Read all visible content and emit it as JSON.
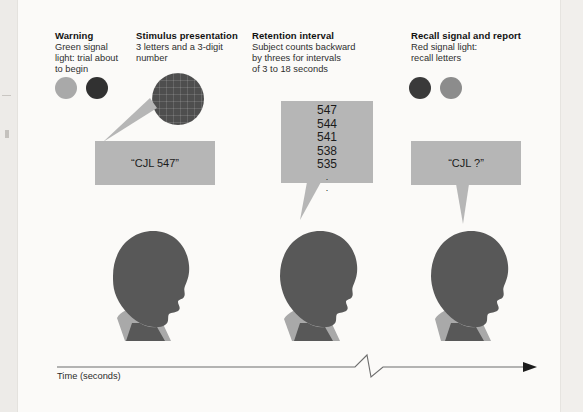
{
  "figure": {
    "time_axis_label": "Time (seconds)"
  },
  "colors": {
    "page_background": "#fbfaf8",
    "bubble_gray": "#b6b6b6",
    "head_dark": "#585858",
    "shoulder_gray": "#a9a9a9",
    "light_green_signal": "#a9a9a9",
    "dark_signal": "#3a3a3a",
    "red_signal": "#4a4a4a",
    "gray_signal": "#8c8c8c",
    "axis_line": "#6d6d6d"
  },
  "columns": [
    {
      "key": "warning",
      "title": "Warning",
      "desc": "Green signal\nlight: trial about\nto begin",
      "lights": [
        {
          "name": "green-signal-light",
          "color": "#a9a9a9"
        },
        {
          "name": "off-signal-light",
          "color": "#313131"
        }
      ]
    },
    {
      "key": "stimulus",
      "title": "Stimulus presentation",
      "desc": "3 letters and a 3-digit\nnumber",
      "card_name": "stimulus-card"
    },
    {
      "key": "retention",
      "title": "Retention interval",
      "desc": "Subject counts backward\nby threes for intervals\nof 3 to 18 seconds"
    },
    {
      "key": "recall",
      "title": "Recall signal and report",
      "desc": "Red signal light:\nrecall letters",
      "lights": [
        {
          "name": "red-signal-light",
          "color": "#3a3a3a"
        },
        {
          "name": "off-signal-light",
          "color": "#8c8c8c"
        }
      ]
    }
  ],
  "bubbles": {
    "stimulus": {
      "text": "“CJL 547”"
    },
    "retention": {
      "counts": [
        "547",
        "544",
        "541",
        "538",
        "535"
      ],
      "ellipsis": [
        "·",
        "·"
      ]
    },
    "recall": {
      "text": "“CJL ?”"
    }
  }
}
